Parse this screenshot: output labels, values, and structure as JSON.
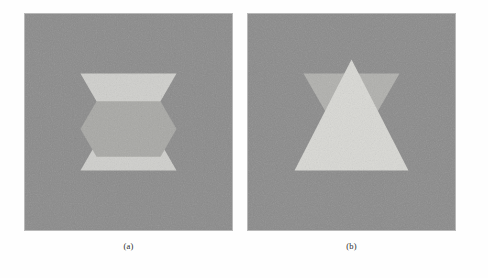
{
  "figure": {
    "background": "#fefefe",
    "panel_count": 2
  },
  "palette": {
    "panel_background": "#8b8b8b",
    "panel_border": "#b9b9b9",
    "bright_triangle": "#d2d2cf",
    "mid_triangle": "#b4b4b1",
    "dark_overlap": "#a0a09d",
    "caption_color": "#2a2a2a"
  },
  "panels": [
    {
      "id": "panel-a",
      "caption": "(a)",
      "x": 24,
      "y": 13,
      "width": 209,
      "height": 218,
      "description": "Noisy gray square containing a Star-of-David configuration in which the downward-pointing triangle appears light and the central overlap region appears darker than the outer lobes.",
      "shapes": [
        {
          "name": "downward-triangle",
          "orientation": "down",
          "fill": "#cfcfcc",
          "points": "56,60 153,60 104.5,144"
        },
        {
          "name": "upward-triangle",
          "orientation": "up",
          "fill": "#cfcfcc",
          "points": "104.5,74 153,158 56,158"
        },
        {
          "name": "hexagon-overlap",
          "fill": "#a8a8a5",
          "points": "72.2,88 136.8,88 153,116 136.8,144 72.2,144 56,116"
        }
      ]
    },
    {
      "id": "panel-b",
      "caption": "(b)",
      "x": 247,
      "y": 13,
      "width": 209,
      "height": 218,
      "description": "Noisy gray square containing a bright upward-pointing triangle that occludes a darker downward-pointing triangle behind it; the darker triangle's two upper lobes and lower apex remain visible.",
      "shapes": [
        {
          "name": "downward-triangle-behind",
          "orientation": "down",
          "fill": "#b0b0ad",
          "points": "56,60 153,60 104.5,144"
        },
        {
          "name": "upward-triangle-front",
          "orientation": "up",
          "fill": "#d8d8d4",
          "points": "104.5,46 162,158 47,158"
        }
      ]
    }
  ],
  "captions": {
    "a": "(a)",
    "b": "(b)"
  }
}
